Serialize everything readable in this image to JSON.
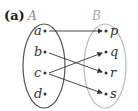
{
  "part_label": "(a)",
  "sets": {
    "A": {
      "name": "A",
      "elements": [
        "a",
        "b",
        "c",
        "d"
      ],
      "color": "#555555",
      "name_color": "#888888"
    },
    "B": {
      "name": "B",
      "elements": [
        "p",
        "q",
        "r",
        "s"
      ],
      "color": "#bbbbbb",
      "name_color": "#aaaaaa"
    }
  },
  "mappings": [
    {
      "from": "a",
      "to": "p"
    },
    {
      "from": "b",
      "to": "r"
    },
    {
      "from": "c",
      "to": "q"
    },
    {
      "from": "c",
      "to": "s"
    }
  ]
}
